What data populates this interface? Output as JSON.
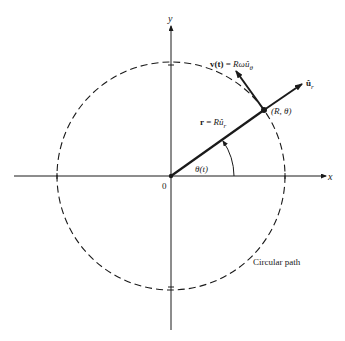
{
  "figure": {
    "axes": {
      "x_label": "x",
      "y_label": "y",
      "origin_label": "0"
    },
    "circle": {
      "label": "Circular path",
      "style": "dashed"
    },
    "position_vector": {
      "label_lhs": "r",
      "label_eq": " = ",
      "label_rhs": "Rû",
      "label_sub": "r"
    },
    "velocity_vector": {
      "label_lhs": "v(t)",
      "label_eq": " = ",
      "label_rhs": "Rωû",
      "label_sub": "θ"
    },
    "unit_vector": {
      "label": "û",
      "label_sub": "r"
    },
    "point": {
      "label": "(R, θ)"
    },
    "angle": {
      "label": "θ(t)"
    },
    "colors": {
      "ink": "#1a1a1a",
      "background": "#ffffff"
    }
  }
}
